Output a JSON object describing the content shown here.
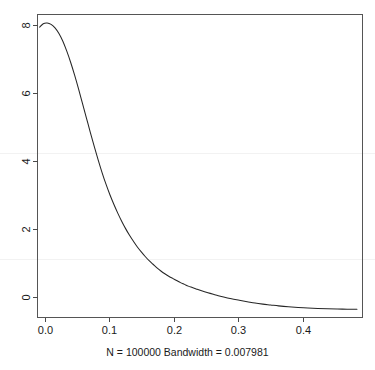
{
  "chart_data": {
    "type": "line",
    "title": "",
    "subtitle": "",
    "xlabel": "N = 100000   Bandwidth = 0.007981",
    "ylabel": "",
    "xlim": [
      -0.0088,
      0.4885
    ],
    "ylim": [
      -0.195,
      8.38
    ],
    "grid": false,
    "legend": null,
    "xticks": [
      0.0,
      0.1,
      0.2,
      0.3,
      0.4
    ],
    "xticklabels": [
      "0.0",
      "0.1",
      "0.2",
      "0.3",
      "0.4"
    ],
    "yticks": [
      0,
      2,
      4,
      6,
      8
    ],
    "yticklabels": [
      "0",
      "2",
      "4",
      "6",
      "8"
    ],
    "series": [
      {
        "name": "density",
        "x": [
          -0.0055,
          0.0,
          0.006,
          0.012,
          0.018,
          0.024,
          0.03,
          0.036,
          0.042,
          0.048,
          0.054,
          0.06,
          0.066,
          0.072,
          0.078,
          0.084,
          0.09,
          0.096,
          0.102,
          0.108,
          0.114,
          0.12,
          0.126,
          0.132,
          0.138,
          0.144,
          0.15,
          0.156,
          0.162,
          0.168,
          0.174,
          0.18,
          0.186,
          0.192,
          0.198,
          0.204,
          0.21,
          0.216,
          0.222,
          0.228,
          0.234,
          0.24,
          0.252,
          0.264,
          0.276,
          0.288,
          0.3,
          0.312,
          0.324,
          0.336,
          0.348,
          0.36,
          0.375,
          0.39,
          0.405,
          0.42,
          0.435,
          0.45,
          0.465,
          0.48
        ],
        "y": [
          8.02,
          8.12,
          8.14,
          8.1,
          8.0,
          7.84,
          7.62,
          7.34,
          7.02,
          6.66,
          6.27,
          5.86,
          5.45,
          5.04,
          4.64,
          4.26,
          3.9,
          3.57,
          3.27,
          3.0,
          2.75,
          2.52,
          2.31,
          2.12,
          1.95,
          1.79,
          1.65,
          1.52,
          1.4,
          1.3,
          1.2,
          1.11,
          1.03,
          0.96,
          0.9,
          0.84,
          0.78,
          0.73,
          0.68,
          0.64,
          0.6,
          0.56,
          0.49,
          0.43,
          0.37,
          0.32,
          0.28,
          0.24,
          0.2,
          0.17,
          0.145,
          0.12,
          0.095,
          0.075,
          0.06,
          0.048,
          0.038,
          0.031,
          0.026,
          0.022
        ]
      }
    ]
  },
  "axes": {
    "x_caption": "N = 100000   Bandwidth = 0.007981"
  }
}
